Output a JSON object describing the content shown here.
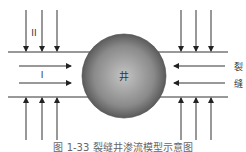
{
  "diagram": {
    "center_label": "井",
    "region_labels": {
      "upper": "II",
      "middle": "I"
    },
    "side_label": [
      "裂",
      "缝"
    ],
    "caption": "图 1-33  裂缝井渗流模型示意图",
    "colors": {
      "line": "#333333",
      "sphere_light": "#c8c8c8",
      "sphere_dark": "#4a4a4a"
    }
  }
}
